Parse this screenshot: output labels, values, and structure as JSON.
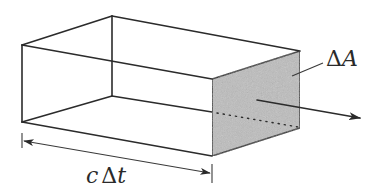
{
  "diagram": {
    "type": "3d-box-flux-illustration",
    "colors": {
      "background": "#ffffff",
      "edges": "#2b2b2b",
      "shaded_face": "#bdbdbd"
    },
    "labels": {
      "area": "ΔA",
      "area_delta": "Δ",
      "area_var": "A",
      "length": "cΔt",
      "length_c": "c",
      "length_delta": "Δ",
      "length_t": "t"
    },
    "elements": [
      {
        "name": "box-wireframe",
        "description": "rectangular box drawn in perspective"
      },
      {
        "name": "shaded-end-face",
        "label": "ΔA"
      },
      {
        "name": "flow-arrow",
        "description": "arrow exiting through shaded face to the right"
      },
      {
        "name": "length-dimension",
        "label": "cΔt",
        "description": "double-headed arrow spanning box length"
      }
    ]
  }
}
